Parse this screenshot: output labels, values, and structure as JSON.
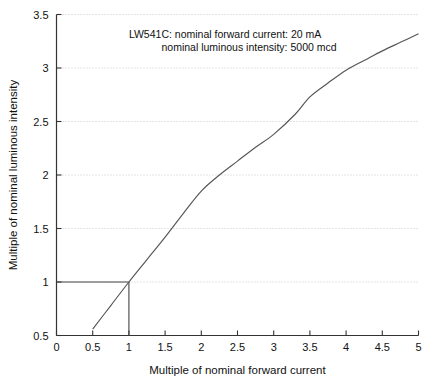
{
  "chart_data": {
    "type": "line",
    "title": "",
    "xlabel": "Multiple of nominal forward current",
    "ylabel": "Multiple of nominal luminous intensity",
    "xlim": [
      0,
      5
    ],
    "ylim": [
      0.5,
      3.5
    ],
    "xticks": [
      "0",
      "0.5",
      "1",
      "1.5",
      "2",
      "2.5",
      "3",
      "3.5",
      "4",
      "4.5",
      "5"
    ],
    "xtick_values": [
      0,
      0.5,
      1,
      1.5,
      2,
      2.5,
      3,
      3.5,
      4,
      4.5,
      5
    ],
    "yticks": [
      "0.5",
      "1",
      "1.5",
      "2",
      "2.5",
      "3",
      "3.5"
    ],
    "ytick_values": [
      0.5,
      1,
      1.5,
      2,
      2.5,
      3,
      3.5
    ],
    "grid": "horizontal-dotted",
    "legend": "none",
    "series": [
      {
        "name": "relative luminous intensity",
        "color": "#555555",
        "x": [
          0.5,
          0.75,
          1.0,
          1.25,
          1.5,
          1.75,
          2.0,
          2.25,
          2.5,
          2.75,
          3.0,
          3.3,
          3.5,
          3.75,
          4.0,
          4.25,
          4.5,
          4.75,
          5.0
        ],
        "y": [
          0.56,
          0.78,
          1.0,
          1.21,
          1.42,
          1.64,
          1.85,
          2.0,
          2.13,
          2.26,
          2.38,
          2.57,
          2.73,
          2.86,
          2.98,
          3.07,
          3.16,
          3.24,
          3.32
        ]
      }
    ],
    "reference_lines": [
      {
        "name": "horizontal-reference-at-1",
        "from": [
          0,
          1
        ],
        "to": [
          1,
          1
        ],
        "color": "#444444"
      },
      {
        "name": "vertical-reference-at-1",
        "from": [
          1,
          0.5
        ],
        "to": [
          1,
          1
        ],
        "color": "#444444"
      }
    ],
    "annotations": [
      {
        "name": "device-annotation-line-1",
        "text": "LW541C: nominal forward current: 20 mA",
        "x": 1.0,
        "y": 3.28
      },
      {
        "name": "device-annotation-line-2",
        "text": "nominal luminous intensity: 5000 mcd",
        "x": 1.45,
        "y": 3.16
      }
    ]
  },
  "colors": {
    "curve": "#555555",
    "axis": "#333333",
    "grid": "#c8c8c8",
    "text": "#111111",
    "background": "#ffffff"
  }
}
